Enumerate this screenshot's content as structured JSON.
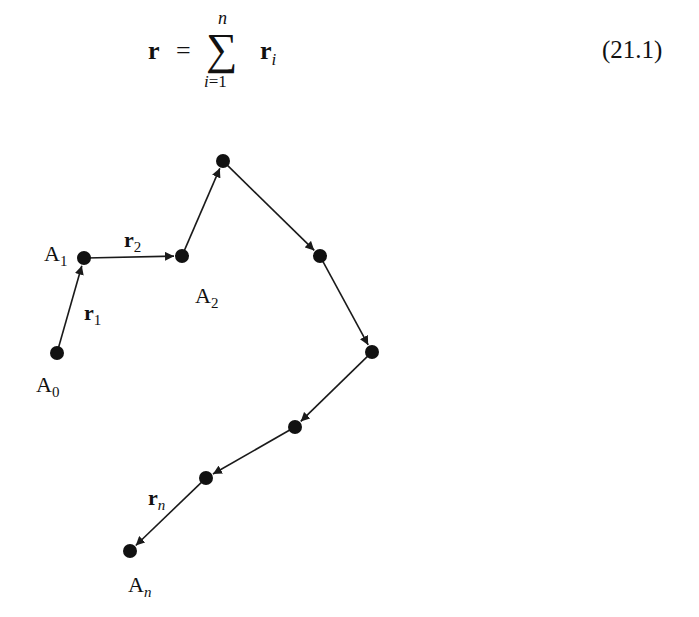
{
  "equation": {
    "lhs": "r",
    "equals": "=",
    "sigma": "∑",
    "upper_limit": "n",
    "lower_limit_var": "i",
    "lower_limit_rest": "=1",
    "term": "r",
    "term_subscript": "i",
    "number": "(21.1)"
  },
  "diagram": {
    "points": [
      {
        "id": "A0",
        "x": 57,
        "y": 353
      },
      {
        "id": "A1",
        "x": 84,
        "y": 258
      },
      {
        "id": "A2",
        "x": 182,
        "y": 256
      },
      {
        "id": "P3",
        "x": 223,
        "y": 161
      },
      {
        "id": "P4",
        "x": 320,
        "y": 256
      },
      {
        "id": "P5",
        "x": 372,
        "y": 352
      },
      {
        "id": "P6",
        "x": 295,
        "y": 427
      },
      {
        "id": "P7",
        "x": 206,
        "y": 478
      },
      {
        "id": "An",
        "x": 130,
        "y": 551
      }
    ],
    "labels": {
      "A0": {
        "base": "A",
        "sub": "0"
      },
      "A1": {
        "base": "A",
        "sub": "1"
      },
      "A2": {
        "base": "A",
        "sub": "2"
      },
      "An": {
        "base": "A",
        "sub": "n"
      },
      "r1": {
        "base": "r",
        "sub": "1"
      },
      "r2": {
        "base": "r",
        "sub": "2"
      },
      "rn": {
        "base": "r",
        "sub": "n"
      }
    },
    "colors": {
      "line": "#1a1a1a",
      "point": "#111111"
    }
  }
}
